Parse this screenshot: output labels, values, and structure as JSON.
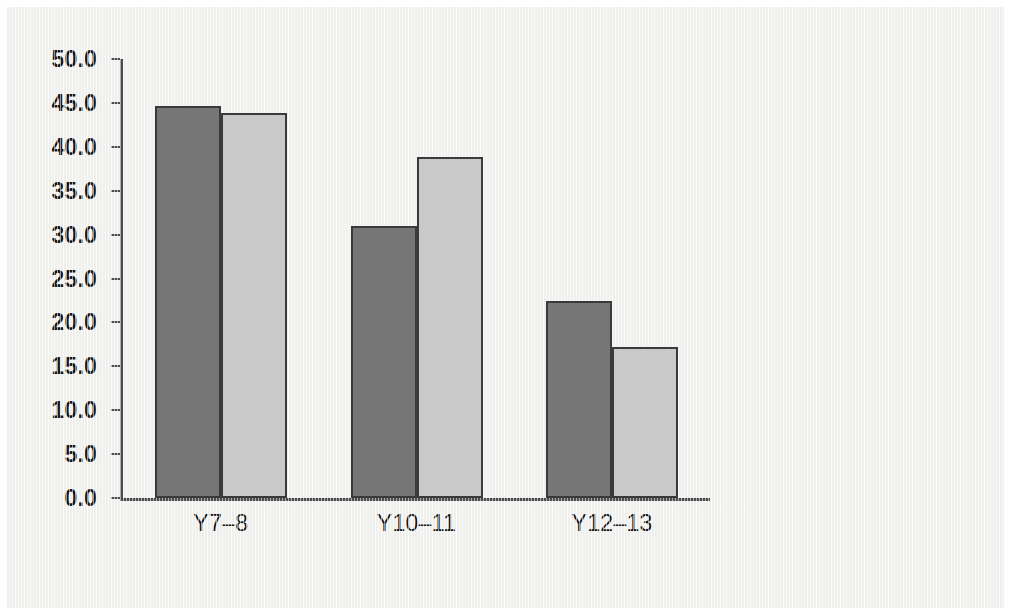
{
  "chart_data": {
    "type": "bar",
    "title": "",
    "xlabel": "",
    "ylabel": "",
    "categories": [
      "Y7–8",
      "Y10–11",
      "Y12–13"
    ],
    "series": [
      {
        "name": "Series 1",
        "values": [
          44.7,
          31.0,
          22.4
        ],
        "color": "#767676"
      },
      {
        "name": "Series 2",
        "values": [
          43.8,
          38.8,
          17.2
        ],
        "color": "#c9c9c9"
      }
    ],
    "ylim": [
      0.0,
      50.0
    ],
    "ytick_step": 5.0,
    "ytick_labels": [
      "50.0",
      "45.0",
      "40.0",
      "35.0",
      "30.0",
      "25.0",
      "20.0",
      "15.0",
      "10.0",
      "5.0",
      "0.0"
    ],
    "ytick_values": [
      50.0,
      45.0,
      40.0,
      35.0,
      30.0,
      25.0,
      20.0,
      15.0,
      10.0,
      5.0,
      0.0
    ],
    "grid": false,
    "legend": null,
    "legend_position": "none",
    "background_color": "#f2f2f0",
    "axis_color": "#4d4d4d",
    "bar_outline_color": "#3a3a3a"
  }
}
